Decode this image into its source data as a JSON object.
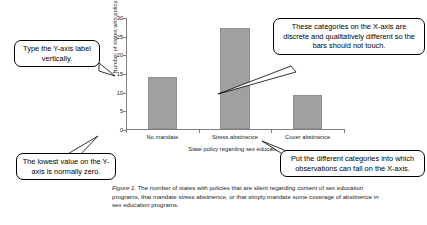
{
  "chart_data": {
    "type": "bar",
    "title": "",
    "categories": [
      "No mandate",
      "Stress abstinence",
      "Cover abstinence"
    ],
    "values": [
      14,
      27,
      9
    ],
    "xlabel": "State policy regarding sex education",
    "ylabel": "Number of states with policy",
    "ylim": [
      0,
      30
    ],
    "yticks": [
      0,
      5,
      10,
      15,
      20,
      25,
      30
    ],
    "grid": false,
    "legend": null,
    "bar_color": "#a0a0a0",
    "axis_color": "#808080"
  },
  "callouts": [
    {
      "id": "yaxis",
      "text": "Type the Y-axis label vertically."
    },
    {
      "id": "xcategories",
      "text": "These categories on the X-axis are discrete and qualitatively different so the bars should not touch."
    },
    {
      "id": "zero",
      "text": "The lowest value on the Y-axis is normally zero."
    },
    {
      "id": "putcat",
      "text": "Put the different categories into which observations can fall on the X-axis."
    }
  ],
  "caption": {
    "figure_number": "Figure 1.",
    "body": " The number of states with policies that are silent regarding content of sex education programs, that mandate stress abstinence, or that simply mandate some coverage of abstinence in sex education programs."
  }
}
